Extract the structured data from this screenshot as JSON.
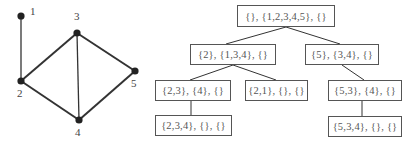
{
  "graph": {
    "nodes": [
      {
        "id": "1",
        "label": "1",
        "x": 21,
        "y": 16,
        "lx": 30,
        "ly": 10
      },
      {
        "id": "2",
        "label": "2",
        "x": 21,
        "y": 81,
        "lx": 17,
        "ly": 92
      },
      {
        "id": "3",
        "label": "3",
        "x": 77,
        "y": 33,
        "lx": 74,
        "ly": 15
      },
      {
        "id": "4",
        "label": "4",
        "x": 79,
        "y": 120,
        "lx": 75,
        "ly": 131
      },
      {
        "id": "5",
        "label": "5",
        "x": 135,
        "y": 71,
        "lx": 131,
        "ly": 82
      }
    ],
    "edges": [
      [
        "1",
        "2"
      ],
      [
        "2",
        "3"
      ],
      [
        "2",
        "4"
      ],
      [
        "3",
        "4"
      ],
      [
        "3",
        "5"
      ],
      [
        "4",
        "5"
      ]
    ]
  },
  "tree": {
    "nodes": [
      {
        "id": "root",
        "label": "{}, {1,2,3,4,5}, {}",
        "x": 237,
        "y": 5,
        "w": 98,
        "h": 22
      },
      {
        "id": "n2",
        "label": "{2}, {1,3,4}, {}",
        "x": 190,
        "y": 44,
        "w": 86,
        "h": 21
      },
      {
        "id": "n5",
        "label": "{5}, {3,4}, {}",
        "x": 305,
        "y": 44,
        "w": 74,
        "h": 21
      },
      {
        "id": "n23",
        "label": "{2,3}, {4}, {}",
        "x": 155,
        "y": 80,
        "w": 76,
        "h": 21
      },
      {
        "id": "n21",
        "label": "{2,1}, {}, {}",
        "x": 245,
        "y": 80,
        "w": 63,
        "h": 21
      },
      {
        "id": "n53",
        "label": "{5,3}, {4}, {}",
        "x": 328,
        "y": 80,
        "w": 74,
        "h": 21
      },
      {
        "id": "n234",
        "label": "{2,3,4}, {}, {}",
        "x": 155,
        "y": 115,
        "w": 77,
        "h": 21
      },
      {
        "id": "n534",
        "label": "{5,3,4}, {}, {}",
        "x": 328,
        "y": 116,
        "w": 74,
        "h": 21
      }
    ],
    "edges": [
      {
        "from": "root",
        "to": "n2",
        "x1": 286,
        "y1": 27,
        "x2": 226,
        "y2": 44
      },
      {
        "from": "root",
        "to": "n5",
        "x1": 286,
        "y1": 27,
        "x2": 340,
        "y2": 44
      },
      {
        "from": "n2",
        "to": "n23",
        "x1": 233,
        "y1": 65,
        "x2": 190,
        "y2": 80
      },
      {
        "from": "n2",
        "to": "n21",
        "x1": 233,
        "y1": 65,
        "x2": 276,
        "y2": 80
      },
      {
        "from": "n5",
        "to": "n53",
        "x1": 342,
        "y1": 65,
        "x2": 364,
        "y2": 80
      },
      {
        "from": "n23",
        "to": "n234",
        "x1": 191,
        "y1": 101,
        "x2": 191,
        "y2": 115
      },
      {
        "from": "n53",
        "to": "n534",
        "x1": 362,
        "y1": 101,
        "x2": 362,
        "y2": 116
      }
    ]
  },
  "colors": {
    "line": "#333333",
    "node": "#222222",
    "box_border": "#555555",
    "text": "#555555"
  }
}
